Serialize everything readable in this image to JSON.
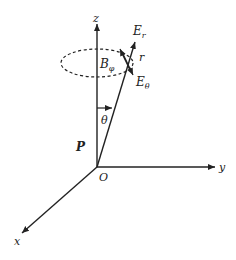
{
  "diagram": {
    "labels": {
      "z_axis": "z",
      "y_axis": "y",
      "x_axis": "x",
      "origin": "O",
      "dipole_moment": "P",
      "angle": "θ",
      "radius": "r",
      "e_radial": "E",
      "e_radial_sub": "r",
      "e_theta": "E",
      "e_theta_sub": "θ",
      "b_phi": "B",
      "b_phi_sub": "φ"
    },
    "colors": {
      "line": "#222222",
      "background": "#ffffff"
    }
  }
}
